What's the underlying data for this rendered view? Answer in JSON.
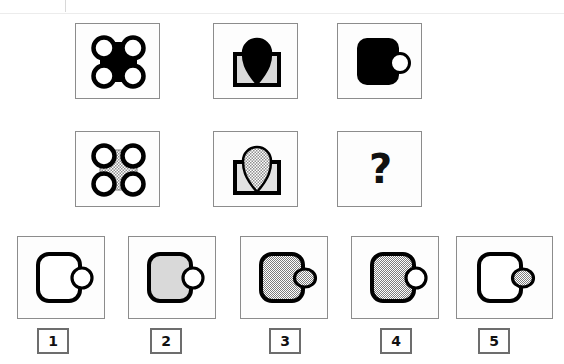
{
  "header": {
    "ghost_text": "",
    "watermark": ""
  },
  "puzzle": {
    "type": "non-verbal-reasoning-matrix",
    "question_mark": "?",
    "matrix": {
      "rows": 2,
      "cols": 3,
      "cells": [
        {
          "id": "r1c1",
          "row": 1,
          "col": 1,
          "shape": "four-circles-on-rounded-square",
          "body_fill": "#000000",
          "circle_fill": "#ffffff",
          "outline": "#000000",
          "description": "Solid black rounded square with four white outlined circles at the corners"
        },
        {
          "id": "r1c2",
          "row": 1,
          "col": 2,
          "shape": "teardrop-on-envelope",
          "body_fill": "#d9d9d9",
          "teardrop_fill": "#000000",
          "outline": "#000000",
          "description": "Light grey rectangle with a solid black teardrop above it"
        },
        {
          "id": "r1c3",
          "row": 1,
          "col": 3,
          "shape": "rounded-square-with-side-circle",
          "body_fill": "#000000",
          "circle_fill": "#ffffff",
          "outline": "#000000",
          "description": "Solid black rounded square with a white outlined circle on its right edge"
        },
        {
          "id": "r2c1",
          "row": 2,
          "col": 1,
          "shape": "four-circles-on-rounded-square",
          "body_fill": "stipple-grey",
          "circle_fill": "#ffffff",
          "outline": "#000000",
          "description": "Stippled grey rounded square with four white outlined circles at the corners"
        },
        {
          "id": "r2c2",
          "row": 2,
          "col": 2,
          "shape": "teardrop-on-envelope",
          "body_fill": "#d9d9d9",
          "teardrop_fill": "stipple-grey",
          "outline": "#000000",
          "description": "Light grey rectangle with a stippled grey teardrop above it"
        },
        {
          "id": "r2c3",
          "row": 2,
          "col": 3,
          "shape": "question-mark",
          "body_fill": "none",
          "outline": "#000000",
          "description": "Missing element, shown as a bold question mark"
        }
      ]
    },
    "options": [
      {
        "number": "1",
        "shape": "rounded-square-with-side-circle",
        "body_fill": "#ffffff",
        "circle_fill": "#ffffff",
        "outline": "#000000",
        "description": "White rounded square with white circle, both black outlined"
      },
      {
        "number": "2",
        "shape": "rounded-square-with-side-circle",
        "body_fill": "#d9d9d9",
        "circle_fill": "#ffffff",
        "outline": "#000000",
        "description": "Light grey rounded square with white circle"
      },
      {
        "number": "3",
        "shape": "rounded-square-with-side-circle",
        "body_fill": "stipple-grey",
        "circle_fill": "stipple-grey",
        "outline": "#000000",
        "description": "Stippled grey rounded square with stippled grey circle"
      },
      {
        "number": "4",
        "shape": "rounded-square-with-side-circle",
        "body_fill": "stipple-grey",
        "circle_fill": "#ffffff",
        "outline": "#000000",
        "description": "Stippled grey rounded square with white circle"
      },
      {
        "number": "5",
        "shape": "rounded-square-with-side-circle",
        "body_fill": "#ffffff",
        "circle_fill": "stipple-grey",
        "outline": "#000000",
        "description": "White rounded square with stippled grey circle"
      }
    ]
  },
  "colors": {
    "black": "#000000",
    "light_grey_fill": "#d9d9d9",
    "stipple_grey": "#b0b0b0",
    "cell_border": "#8c8c8c",
    "number_border": "#6d6d6d",
    "page_background": "#ffffff"
  }
}
